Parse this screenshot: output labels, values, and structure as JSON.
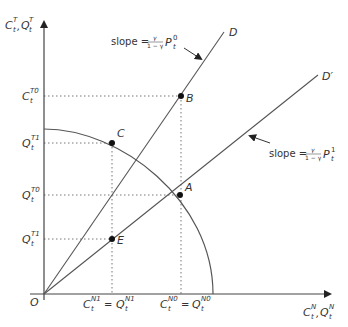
{
  "diagram": {
    "colors": {
      "line": "#555555",
      "dotted": "#777777",
      "point": "#111111",
      "text": "#333333"
    },
    "axes": {
      "y_label_main": "C",
      "y_label_sup1": "T",
      "y_label_sub1": "t",
      "y_label_sep": ",",
      "y_label_main2": "Q",
      "y_label_sup2": "T",
      "y_label_sub2": "t",
      "x_label_main": "C",
      "x_label_sup1": "N",
      "x_label_sub1": "t",
      "x_label_sep": ",",
      "x_label_main2": "Q",
      "x_label_sup2": "N",
      "x_label_sub2": "t",
      "origin": "O"
    },
    "y_ticks": [
      {
        "main": "C",
        "sup": "T0",
        "sub": "t"
      },
      {
        "main": "Q",
        "sup": "T1",
        "sub": "t"
      },
      {
        "main": "Q",
        "sup": "T0",
        "sub": "t"
      },
      {
        "main": "Q",
        "sup": "T1",
        "sub": "t"
      }
    ],
    "x_ticks": [
      {
        "left_main": "C",
        "left_sup": "N1",
        "left_sub": "t",
        "eq": "=",
        "right_main": "Q",
        "right_sup": "N1",
        "right_sub": "t"
      },
      {
        "left_main": "C",
        "left_sup": "N0",
        "left_sub": "t",
        "eq": "=",
        "right_main": "Q",
        "right_sup": "N0",
        "right_sub": "t"
      }
    ],
    "lines": {
      "D": "D",
      "D_prime": "D′"
    },
    "points": {
      "A": "A",
      "B": "B",
      "C": "C",
      "E": "E"
    },
    "annotations": {
      "slope0": {
        "text": "slope =",
        "num": "γ",
        "den": "1 − γ",
        "p": "P",
        "sup": "0",
        "sub": "t"
      },
      "slope1": {
        "text": "slope =",
        "num": "γ",
        "den": "1 − γ",
        "p": "P",
        "sup": "1",
        "sub": "t"
      }
    }
  }
}
